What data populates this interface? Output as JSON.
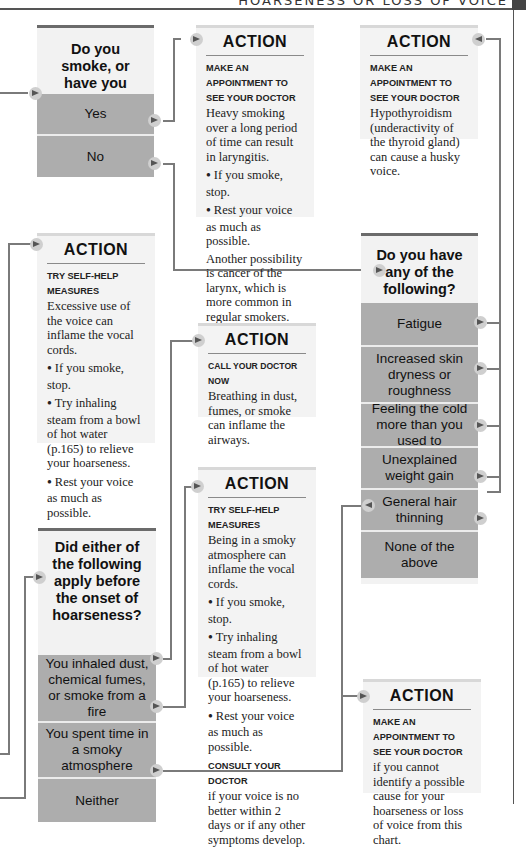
{
  "header": {
    "title": "HOARSENESS OR LOSS OF VOICE"
  },
  "questions": {
    "smoke": {
      "title": "Do you smoke, or have you smoked in the past?",
      "options": [
        "Yes",
        "No"
      ]
    },
    "symptoms": {
      "title": "Do you have any of the following?",
      "options": [
        "Fatigue",
        "Increased skin dryness or roughness",
        "Feeling the cold more than you used to",
        "Unexplained weight gain",
        "General hair thinning",
        "None of the above"
      ]
    },
    "onset": {
      "title": "Did either of the following apply before the onset of hoarseness?",
      "options": [
        "You inhaled dust, chemical fumes, or smoke from a fire",
        "You spent time in a smoky atmosphere",
        "Neither"
      ]
    }
  },
  "actions": {
    "smoking": {
      "title": "ACTION",
      "label": "MAKE AN APPOINTMENT TO SEE YOUR DOCTOR",
      "text": "Heavy smoking over a long period of time can result in laryngitis.",
      "bullets": [
        "If you smoke, stop.",
        "Rest your voice as much as possible."
      ],
      "after": "Another possibility is cancer of the larynx, which is more common in regular smokers."
    },
    "thyroid": {
      "title": "ACTION",
      "label": "MAKE AN APPOINTMENT TO SEE YOUR DOCTOR",
      "text": "Hypothyroidism (underactivity of the thyroid gland) can cause a husky voice."
    },
    "overuse": {
      "title": "ACTION",
      "label": "TRY SELF-HELP MEASURES",
      "text": "Excessive use of the voice can inflame the vocal cords.",
      "bullets": [
        "If you smoke, stop.",
        "Try inhaling steam from a bowl of hot water (p.165) to relieve your hoarseness.",
        "Rest your voice as much as possible."
      ],
      "label2": "CONSULT YOUR DOCTOR",
      "text2": "if your voice is no better within 2 days or if any other symptoms develop."
    },
    "fumes": {
      "title": "ACTION",
      "label": "CALL YOUR DOCTOR NOW",
      "text": "Breathing in dust, fumes, or smoke can inflame the airways."
    },
    "smoky": {
      "title": "ACTION",
      "label": "TRY SELF-HELP MEASURES",
      "text": "Being in a smoky atmosphere can inflame the vocal cords.",
      "bullets": [
        "If you smoke, stop.",
        "Try inhaling steam from a bowl of hot water (p.165) to relieve your hoarseness.",
        "Rest your voice as much as possible."
      ],
      "label2": "CONSULT YOUR DOCTOR",
      "text2": "if your voice is no better within 2 days or if any other symptoms develop."
    },
    "unknown": {
      "title": "ACTION",
      "label": "MAKE AN APPOINTMENT TO SEE YOUR DOCTOR",
      "text": "if you cannot identify a possible cause for your hoarseness or loss of voice from this chart."
    }
  },
  "colors": {
    "question_bg": "#f2f2f2",
    "options_bg": "#adadad",
    "action_bg": "#f3f3f3",
    "connector": "#7a7a7a"
  }
}
